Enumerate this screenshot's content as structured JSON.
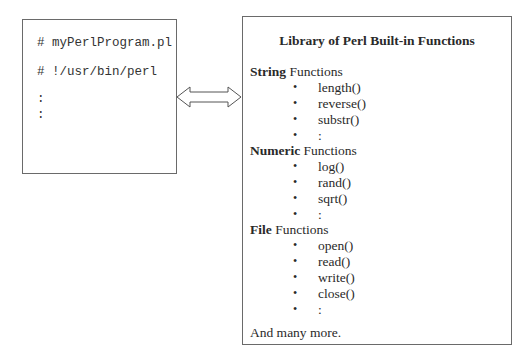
{
  "program_box": {
    "lines": [
      "# myPerlProgram.pl",
      "# !/usr/bin/perl",
      ":",
      ":"
    ]
  },
  "connector": {
    "icon": "double-arrow-icon"
  },
  "library_box": {
    "title": "Library of Perl Built-in Functions",
    "sections": [
      {
        "bold": "String",
        "rest": " Functions",
        "items": [
          "length()",
          "reverse()",
          "substr()",
          ":"
        ]
      },
      {
        "bold": "Numeric",
        "rest": " Functions",
        "items": [
          "log()",
          "rand()",
          "sqrt()",
          ":"
        ]
      },
      {
        "bold": "File",
        "rest": " Functions",
        "items": [
          "open()",
          "read()",
          "write()",
          "close()",
          ":"
        ]
      }
    ],
    "bullet": "•",
    "footer": "And many more."
  }
}
